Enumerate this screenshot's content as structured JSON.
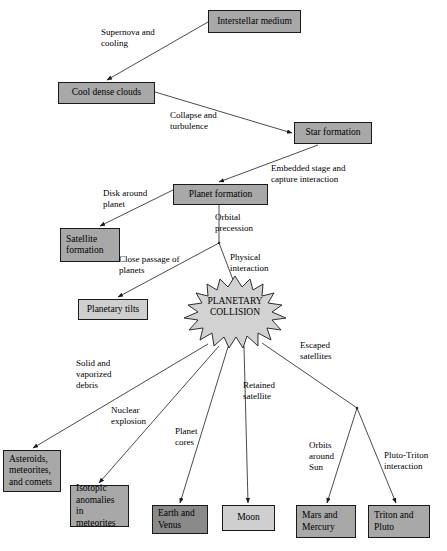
{
  "diagram": {
    "colors": {
      "node_mid": "#a8a8a8",
      "node_dark": "#8a8a8a",
      "node_light": "#cfcfcf",
      "stroke": "#1a1a1a",
      "background": "#ffffff"
    },
    "nodes": [
      {
        "id": "interstellar_medium",
        "label": "Interstellar medium",
        "fill": "mid",
        "x": 208,
        "y": 10,
        "w": 93,
        "h": 23,
        "align": "center"
      },
      {
        "id": "cool_dense_clouds",
        "label": "Cool dense clouds",
        "fill": "mid",
        "x": 58,
        "y": 82,
        "w": 97,
        "h": 22,
        "align": "center"
      },
      {
        "id": "star_formation",
        "label": "Star formation",
        "fill": "mid",
        "x": 294,
        "y": 122,
        "w": 78,
        "h": 22,
        "align": "center"
      },
      {
        "id": "planet_formation",
        "label": "Planet formation",
        "fill": "mid",
        "x": 173,
        "y": 184,
        "w": 95,
        "h": 21,
        "align": "center"
      },
      {
        "id": "satellite_formation",
        "label": "Satellite\nformation",
        "fill": "mid",
        "x": 60,
        "y": 228,
        "w": 60,
        "h": 34,
        "align": "left"
      },
      {
        "id": "planetary_tilts",
        "label": "Planetary tilts",
        "fill": "light",
        "x": 78,
        "y": 299,
        "w": 70,
        "h": 21,
        "align": "center"
      },
      {
        "id": "asteroids",
        "label": "Asteroids,\nmeteorites,\nand comets",
        "fill": "mid",
        "x": 3,
        "y": 450,
        "w": 58,
        "h": 42,
        "align": "left"
      },
      {
        "id": "isotopic_anomalies",
        "label": "Isotopic\nanomalies in\nmeteorites",
        "fill": "mid",
        "x": 70,
        "y": 485,
        "w": 59,
        "h": 42,
        "align": "left"
      },
      {
        "id": "earth_and_venus",
        "label": "Earth and\nVenus",
        "fill": "dark",
        "x": 152,
        "y": 505,
        "w": 56,
        "h": 29,
        "align": "left"
      },
      {
        "id": "moon",
        "label": "Moon",
        "fill": "light",
        "x": 222,
        "y": 505,
        "w": 53,
        "h": 26,
        "align": "center"
      },
      {
        "id": "mars_and_mercury",
        "label": "Mars and\nMercury",
        "fill": "mid",
        "x": 296,
        "y": 505,
        "w": 60,
        "h": 33,
        "align": "left"
      },
      {
        "id": "triton_and_pluto",
        "label": "Triton and\nPluto",
        "fill": "mid",
        "x": 368,
        "y": 505,
        "w": 62,
        "h": 33,
        "align": "left"
      }
    ],
    "collision": {
      "id": "planetary_collision",
      "label": "PLANETARY\nCOLLISION",
      "fill": "#d2d2d2"
    },
    "edge_labels": [
      {
        "id": "supernova_and_cooling",
        "text": "Supernova and\ncooling",
        "x": 101,
        "y": 27
      },
      {
        "id": "collapse_and_turbulence",
        "text": "Collapse and\nturbulence",
        "x": 170,
        "y": 110
      },
      {
        "id": "embedded_stage",
        "text": "Embedded stage and\ncapture interaction",
        "x": 271,
        "y": 163
      },
      {
        "id": "disk_around_planet",
        "text": "Disk around\nplanet",
        "x": 103,
        "y": 188
      },
      {
        "id": "orbital_precession",
        "text": "Orbital\nprecession",
        "x": 215,
        "y": 212
      },
      {
        "id": "close_passage_of_planets",
        "text": "Close passage of\nplanets",
        "x": 119,
        "y": 254
      },
      {
        "id": "physical_interaction",
        "text": "Physical\ninteraction",
        "x": 230,
        "y": 252
      },
      {
        "id": "solid_and_vaporized_debris",
        "text": "Solid and\nvaporized\ndebris",
        "x": 76,
        "y": 358
      },
      {
        "id": "escaped_satellites",
        "text": "Escaped\nsatellites",
        "x": 300,
        "y": 340
      },
      {
        "id": "retained_satellite",
        "text": "Retained\nsatellite",
        "x": 243,
        "y": 380
      },
      {
        "id": "nuclear_explosion",
        "text": "Nuclear\nexplosion",
        "x": 111,
        "y": 405
      },
      {
        "id": "planet_cores",
        "text": "Planet\ncores",
        "x": 175,
        "y": 426
      },
      {
        "id": "orbits_around_sun",
        "text": "Orbits\naround\nSun",
        "x": 309,
        "y": 440
      },
      {
        "id": "pluto_triton_interaction",
        "text": "Pluto-Triton\ninteraction",
        "x": 384,
        "y": 450
      }
    ],
    "edges": [
      {
        "id": "edge-interstellar-to-clouds",
        "from": "interstellar_medium",
        "to": "cool_dense_clouds",
        "x1": 208,
        "y1": 22,
        "x2": 107,
        "y2": 80
      },
      {
        "id": "edge-clouds-to-star",
        "from": "cool_dense_clouds",
        "to": "star_formation",
        "x1": 155,
        "y1": 92,
        "x2": 292,
        "y2": 133
      },
      {
        "id": "edge-star-to-planet",
        "from": "star_formation",
        "to": "planet_formation",
        "x1": 318,
        "y1": 145,
        "x2": 219,
        "y2": 182
      },
      {
        "id": "edge-planet-to-satellite",
        "from": "planet_formation",
        "to": "satellite_formation",
        "x1": 173,
        "y1": 190,
        "x2": 100,
        "y2": 226
      },
      {
        "id": "edge-planet-stem",
        "from": "planet_formation",
        "to": "branch_point_1",
        "x1": 219,
        "y1": 205,
        "x2": 219,
        "y2": 243
      },
      {
        "id": "edge-branch-to-tilts",
        "from": "branch_point_1",
        "to": "planetary_tilts",
        "x1": 219,
        "y1": 243,
        "x2": 118,
        "y2": 297
      },
      {
        "id": "edge-branch-to-collision",
        "from": "branch_point_1",
        "to": "planetary_collision",
        "x1": 219,
        "y1": 243,
        "x2": 235,
        "y2": 285
      },
      {
        "id": "edge-collision-to-asteroids",
        "from": "planetary_collision",
        "to": "asteroids",
        "x1": 208,
        "y1": 344,
        "x2": 33,
        "y2": 448
      },
      {
        "id": "edge-collision-to-isotopic",
        "from": "planetary_collision",
        "to": "isotopic_anomalies",
        "x1": 219,
        "y1": 346,
        "x2": 99,
        "y2": 483
      },
      {
        "id": "edge-collision-to-earth",
        "from": "planetary_collision",
        "to": "earth_and_venus",
        "x1": 228,
        "y1": 347,
        "x2": 180,
        "y2": 503
      },
      {
        "id": "edge-collision-to-moon",
        "from": "planetary_collision",
        "to": "moon",
        "x1": 244,
        "y1": 346,
        "x2": 248,
        "y2": 503
      },
      {
        "id": "edge-collision-to-branch2",
        "from": "planetary_collision",
        "to": "branch_point_2",
        "x1": 262,
        "y1": 343,
        "x2": 357,
        "y2": 408
      },
      {
        "id": "edge-branch2-to-mars",
        "from": "branch_point_2",
        "to": "mars_and_mercury",
        "x1": 357,
        "y1": 408,
        "x2": 327,
        "y2": 503
      },
      {
        "id": "edge-branch2-to-triton",
        "from": "branch_point_2",
        "to": "triton_and_pluto",
        "x1": 357,
        "y1": 408,
        "x2": 396,
        "y2": 503
      }
    ]
  }
}
